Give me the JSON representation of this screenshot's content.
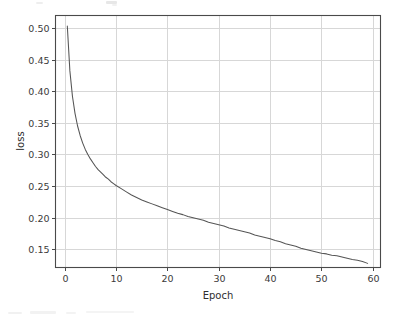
{
  "chart_data": {
    "type": "line",
    "title": "",
    "xlabel": "Epoch",
    "ylabel": "loss",
    "xlim": [
      -1.8,
      61.5
    ],
    "ylim": [
      0.1215,
      0.5195
    ],
    "grid": true,
    "legend": null,
    "legend_position": "none",
    "line_color": "#555555",
    "grid_color": "#d7d7d7",
    "spine_color": "#4a4a4a",
    "background_color": "#ffffff",
    "xticks": [
      0,
      10,
      20,
      30,
      40,
      50,
      60
    ],
    "xtick_labels": [
      "0",
      "10",
      "20",
      "30",
      "40",
      "50",
      "60"
    ],
    "yticks": [
      0.15,
      0.2,
      0.25,
      0.3,
      0.35,
      0.4,
      0.45,
      0.5
    ],
    "ytick_labels": [
      "0.15",
      "0.20",
      "0.25",
      "0.30",
      "0.35",
      "0.40",
      "0.45",
      "0.50"
    ],
    "series": [
      {
        "name": "loss",
        "x": [
          0.5,
          1,
          1.5,
          2,
          2.5,
          3,
          3.5,
          4,
          4.5,
          5,
          5.5,
          6,
          6.5,
          7,
          7.5,
          8,
          8.5,
          9,
          9.5,
          10,
          11,
          12,
          13,
          14,
          15,
          16,
          17,
          18,
          19,
          20,
          21,
          22,
          23,
          24,
          25,
          26,
          27,
          28,
          29,
          30,
          31,
          32,
          33,
          34,
          35,
          36,
          37,
          38,
          39,
          40,
          41,
          42,
          43,
          44,
          45,
          46,
          47,
          48,
          49,
          50,
          51,
          52,
          53,
          54,
          55,
          56,
          57,
          58,
          59
        ],
        "values": [
          0.503,
          0.432,
          0.392,
          0.365,
          0.345,
          0.33,
          0.318,
          0.308,
          0.3,
          0.293,
          0.287,
          0.281,
          0.276,
          0.272,
          0.268,
          0.264,
          0.261,
          0.257,
          0.254,
          0.251,
          0.246,
          0.241,
          0.236,
          0.232,
          0.228,
          0.225,
          0.222,
          0.219,
          0.216,
          0.213,
          0.21,
          0.207,
          0.205,
          0.202,
          0.2,
          0.198,
          0.196,
          0.193,
          0.191,
          0.189,
          0.187,
          0.184,
          0.182,
          0.18,
          0.178,
          0.176,
          0.173,
          0.171,
          0.169,
          0.167,
          0.164,
          0.162,
          0.159,
          0.157,
          0.155,
          0.152,
          0.15,
          0.148,
          0.146,
          0.144,
          0.143,
          0.141,
          0.14,
          0.138,
          0.136,
          0.134,
          0.133,
          0.131,
          0.128
        ]
      }
    ]
  }
}
